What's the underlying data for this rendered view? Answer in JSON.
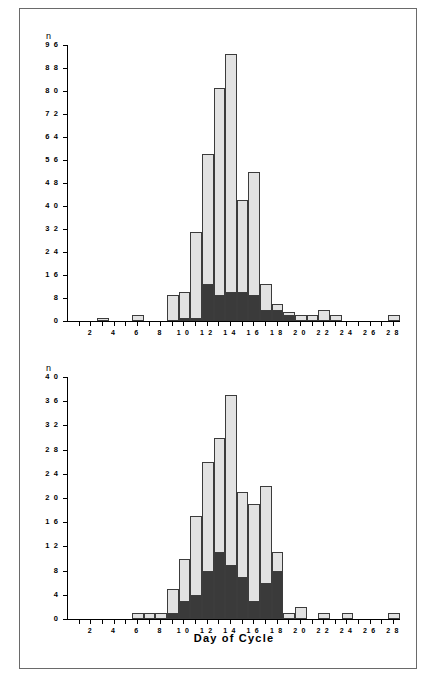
{
  "figure": {
    "xaxis_title": "Day of Cycle",
    "n_symbol": "n",
    "legend": {
      "equals": "=",
      "matings_label": "MATINGS",
      "conceptions_label": "CONCEPTIONS",
      "matings_color": "#e2e2e2",
      "conceptions_color": "#3a3a3a"
    }
  },
  "chart_data": [
    {
      "type": "bar",
      "id": "macaca-mulatta",
      "title": "Macaca  mulatta",
      "reference": "HARTMAN [154]",
      "xlabel": "Day of Cycle",
      "ylabel": "n",
      "stacked": true,
      "grid": false,
      "legend_position": "top-right",
      "ylim": [
        0,
        96
      ],
      "yticks": [
        0,
        8,
        16,
        24,
        32,
        40,
        48,
        56,
        64,
        72,
        80,
        88,
        96
      ],
      "xlim": [
        1,
        28
      ],
      "xticks": [
        2,
        4,
        6,
        8,
        10,
        12,
        14,
        16,
        18,
        20,
        22,
        24,
        26,
        28
      ],
      "categories": [
        1,
        2,
        3,
        4,
        5,
        6,
        7,
        8,
        9,
        10,
        11,
        12,
        13,
        14,
        15,
        16,
        17,
        18,
        19,
        20,
        21,
        22,
        23,
        24,
        25,
        26,
        27,
        28
      ],
      "series": [
        {
          "name": "MATINGS",
          "values": [
            0,
            0,
            1,
            0,
            0,
            2,
            0,
            0,
            9,
            10,
            31,
            58,
            81,
            93,
            42,
            52,
            13,
            6,
            3,
            2,
            2,
            4,
            2,
            0,
            0,
            0,
            0,
            2
          ]
        },
        {
          "name": "CONCEPTIONS",
          "values": [
            0,
            0,
            0,
            0,
            0,
            0,
            0,
            0,
            0,
            1,
            1,
            13,
            9,
            10,
            10,
            9,
            4,
            4,
            2,
            0,
            0,
            0,
            0,
            0,
            0,
            0,
            0,
            0
          ]
        }
      ]
    },
    {
      "type": "bar",
      "id": "papio-cynocephalus",
      "title": "Papio  cynocephalus",
      "reference": "HENDRICKX et al. [155]",
      "xlabel": "Day of Cycle",
      "ylabel": "n",
      "stacked": true,
      "grid": false,
      "legend_position": "top-right",
      "ylim": [
        0,
        40
      ],
      "yticks": [
        0,
        4,
        8,
        12,
        16,
        20,
        24,
        28,
        32,
        36,
        40
      ],
      "xlim": [
        1,
        28
      ],
      "xticks": [
        2,
        4,
        6,
        8,
        10,
        12,
        14,
        16,
        18,
        20,
        22,
        24,
        26,
        28
      ],
      "categories": [
        1,
        2,
        3,
        4,
        5,
        6,
        7,
        8,
        9,
        10,
        11,
        12,
        13,
        14,
        15,
        16,
        17,
        18,
        19,
        20,
        21,
        22,
        23,
        24,
        25,
        26,
        27,
        28
      ],
      "series": [
        {
          "name": "MATINGS",
          "values": [
            0,
            0,
            0,
            0,
            0,
            1,
            1,
            1,
            5,
            10,
            17,
            26,
            30,
            37,
            21,
            19,
            22,
            11,
            1,
            2,
            0,
            1,
            0,
            1,
            0,
            0,
            0,
            1
          ]
        },
        {
          "name": "CONCEPTIONS",
          "values": [
            0,
            0,
            0,
            0,
            0,
            0,
            0,
            0,
            1,
            3,
            4,
            8,
            11,
            9,
            7,
            3,
            6,
            8,
            0,
            0,
            0,
            0,
            0,
            0,
            0,
            0,
            0,
            0
          ]
        }
      ]
    }
  ]
}
